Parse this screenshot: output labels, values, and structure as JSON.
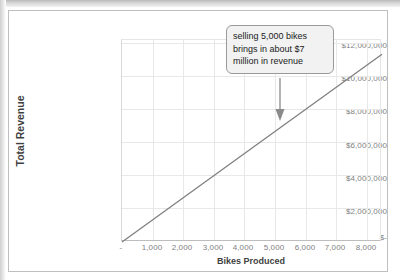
{
  "chart_data": {
    "type": "line",
    "title": "",
    "xlabel": "Bikes Produced",
    "ylabel": "Total Revenue",
    "xlim": [
      0,
      8500
    ],
    "ylim": [
      0,
      12800000
    ],
    "grid": true,
    "legend": "none",
    "line_color": "#808080",
    "x_ticks": [
      "-",
      "1,000",
      "2,000",
      "3,000",
      "4,000",
      "5,000",
      "6,000",
      "7,000",
      "8,000"
    ],
    "x_tick_values": [
      0,
      1000,
      2000,
      3000,
      4000,
      5000,
      6000,
      7000,
      8000
    ],
    "y_ticks": [
      "$-",
      "$2,000,000",
      "$4,000,000",
      "$6,000,000",
      "$8,000,000",
      "$10,000,000",
      "$12,000,000"
    ],
    "y_tick_values": [
      0,
      2000000,
      4000000,
      6000000,
      8000000,
      10000000,
      12000000
    ],
    "series": [
      {
        "name": "Total Revenue",
        "x": [
          0,
          5000,
          8500
        ],
        "values": [
          0,
          7000000,
          11900000
        ]
      }
    ],
    "annotations": [
      {
        "text": "selling 5,000 bikes brings in about $7 million in revenue",
        "line1": "selling 5,000 bikes",
        "line2": "brings in about $7",
        "line3": "million in revenue",
        "points_to_x": 5000,
        "points_to_y": 7000000
      }
    ]
  }
}
